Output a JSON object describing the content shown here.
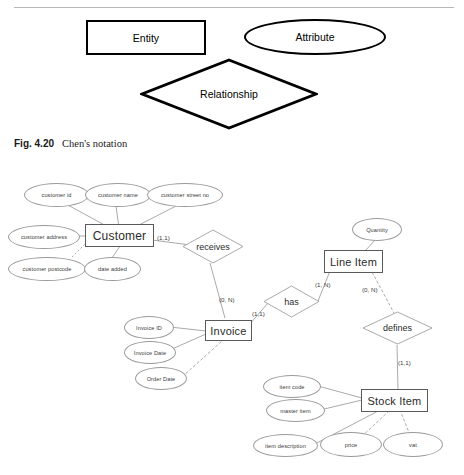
{
  "page": {
    "top_partial_text": "",
    "caption_label": "Fig. 4.20",
    "caption_text": "Chen's notation"
  },
  "legend": {
    "entity_label": "Entity",
    "attribute_label": "Attribute",
    "relationship_label": "Relationship"
  },
  "diagram": {
    "entities": [
      {
        "name": "Customer",
        "label": "Customer"
      },
      {
        "name": "Invoice",
        "label": "Invoice"
      },
      {
        "name": "Line Item",
        "label": "Line Item"
      },
      {
        "name": "Stock Item",
        "label": "Stock Item"
      }
    ],
    "relationships": [
      {
        "name": "receives",
        "label": "receives"
      },
      {
        "name": "has",
        "label": "has"
      },
      {
        "name": "defines",
        "label": "defines"
      }
    ],
    "attributes": {
      "customer": [
        "customer id",
        "customer name",
        "customer street no",
        "customer address",
        "customer postcode",
        "date added"
      ],
      "invoice": [
        "Invoice ID",
        "Invoice Date",
        "Order Date"
      ],
      "line_item": [
        "Quantity"
      ],
      "stock_item": [
        "item code",
        "master item",
        "item description",
        "price",
        "vat"
      ]
    },
    "cardinalities": [
      {
        "name": "customer-receives",
        "label": "(1,1)"
      },
      {
        "name": "receives-invoice",
        "label": "(0, N)"
      },
      {
        "name": "invoice-has",
        "label": "(1,1)"
      },
      {
        "name": "has-line-item",
        "label": "(1, N)"
      },
      {
        "name": "line-item-defines",
        "label": "(0, N)"
      },
      {
        "name": "defines-stock-item",
        "label": "(1,1)"
      }
    ]
  },
  "colors": {
    "ink": "#111111",
    "legend_stroke": "#000000",
    "er_stroke": "#8a8a8a",
    "rule": "#b8b8b8"
  }
}
